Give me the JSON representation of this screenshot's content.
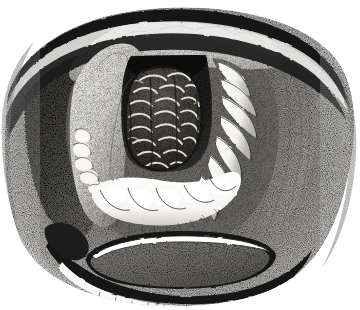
{
  "figure": {
    "kind": "anatomical-engraving",
    "technique": "pen-and-ink stipple / steel engraving",
    "view": "laryngoscopic mirror view of the larynx",
    "background_color": "#ffffff",
    "ink_color": "#111111",
    "caption": "",
    "width": 360,
    "height": 310,
    "palette": {
      "paper": "#ffffff",
      "ink": "#151515",
      "deep_shadow": "#1c1c1c",
      "mid_shadow": "#5a5a5a",
      "light_stipple": "#9a9a9a",
      "highlight": "#f4f4f4",
      "mucosa_light": "#e8e6e2",
      "mucosa_mid": "#8d8b88",
      "mucosa_dark": "#3a3836"
    },
    "structures": [
      {
        "name": "outer-rim",
        "label": "Outer pharyngeal wall / field border",
        "description": "Dark sweeping arc forming the top and sides of the oval field, heaviest at upper-left and upper-right.",
        "tone": "deep_shadow"
      },
      {
        "name": "upper-scalloped-band",
        "label": "Scalloped pale band beneath upper rim",
        "description": "Lobulated light stippled band running along the top inner edge.",
        "tone": "mucosa_light"
      },
      {
        "name": "left-fold",
        "label": "Left aryepiglottic / ventricular fold",
        "description": "Broad pale stippled fold curving down the left of the aperture with a pale lobed margin.",
        "tone": "mucosa_light"
      },
      {
        "name": "right-ribbed-fold",
        "label": "Right ribbed mucosal fold",
        "description": "Series of crescentic white ribs stacked along the right border of the aperture.",
        "tone": "highlight"
      },
      {
        "name": "lower-white-band",
        "label": "Vocal folds / lower pale shelf",
        "description": "Bright white lobulated band sweeping across the floor of the aperture.",
        "tone": "highlight"
      },
      {
        "name": "central-aperture",
        "label": "Laryngeal aperture (dark lumen)",
        "description": "Dark rectangular opening framing the central mass.",
        "tone": "deep_shadow"
      },
      {
        "name": "central-mass",
        "label": "Papillomatous mass filling the aperture",
        "description": "Cauliflower-like stippled tumour with many bright curved highlights, occupying the lumen.",
        "tone": "mucosa_dark"
      },
      {
        "name": "right-outer-mass",
        "label": "Right lateral swelling",
        "description": "Large smoothly shaded swelling with vertical striation sweeping from upper right to lower centre.",
        "tone": "mucosa_mid"
      },
      {
        "name": "left-outer-shadow",
        "label": "Left lateral recess shadow",
        "description": "Dark curved recess between the left fold and the outer rim.",
        "tone": "mid_shadow"
      },
      {
        "name": "lower-lens",
        "label": "Lower lens-shaped cavity (postcricoid / oesophageal inlet)",
        "description": "Almond-shaped dark grey cavity with a bright white upper lip, sitting below the main oval.",
        "tone": "mucosa_mid"
      },
      {
        "name": "bottom-arc",
        "label": "Lower border arc",
        "description": "Heavy black arc with a fine hatched white strip beneath, closing the figure at the bottom.",
        "tone": "ink"
      }
    ]
  }
}
